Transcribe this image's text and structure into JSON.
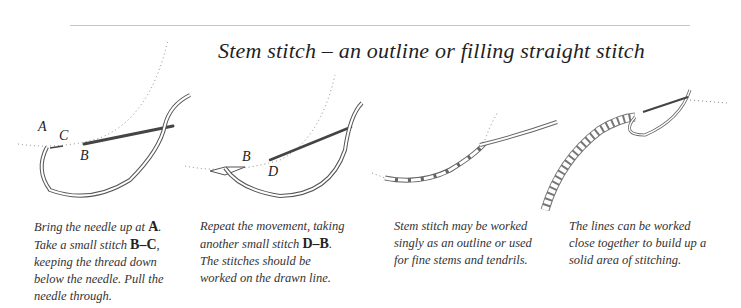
{
  "title": "Stem stitch – an outline or filling straight stitch",
  "diagram_labels": {
    "step1": [
      "A",
      "C",
      "B"
    ],
    "step2": [
      "B",
      "D"
    ]
  },
  "steps": [
    {
      "parts": [
        {
          "t": "Bring the needle up at "
        },
        {
          "b": "A"
        },
        {
          "t": ". Take a small stitch "
        },
        {
          "b": "B–C"
        },
        {
          "t": ", keeping the thread down below the needle. Pull the needle through."
        }
      ],
      "text": "Bring the needle up at A. Take a small stitch B–C, keeping the thread down below the needle. Pull the needle through."
    },
    {
      "parts": [
        {
          "t": "Repeat the movement, taking another small stitch "
        },
        {
          "b": "D–B"
        },
        {
          "t": ". The stitches should be worked on the drawn line."
        }
      ],
      "text": "Repeat the movement, taking another small stitch D–B. The stitches should be worked on the drawn line."
    },
    {
      "parts": [
        {
          "t": "Stem stitch may be worked singly as an outline or used for fine stems and tendrils."
        }
      ],
      "text": "Stem stitch may be worked singly as an outline or used for fine stems and tendrils."
    },
    {
      "parts": [
        {
          "t": "The lines can be worked close together to build up a solid area of stitching."
        }
      ],
      "text": "The lines can be worked close together to build up a solid area of stitching."
    }
  ],
  "colors": {
    "background": "#ffffff",
    "rule": "#c4c4c4",
    "text": "#333333",
    "needle": "#444444"
  }
}
